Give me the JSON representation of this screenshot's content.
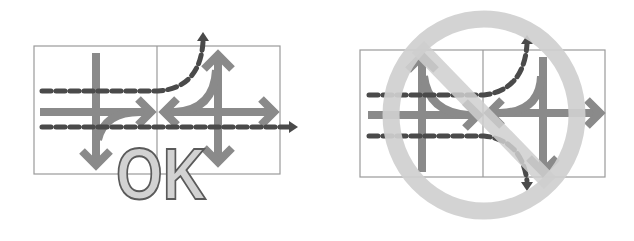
{
  "figure": {
    "left_panel": {
      "label": "OK",
      "verdict": "allowed",
      "description": "Crossing with lanes separated; dashed through lanes pass alongside solid turning arrows"
    },
    "right_panel": {
      "label": "",
      "verdict": "prohibited",
      "symbol": "prohibition-circle",
      "description": "Crossing where dashed paths curve across the solid turning arrows"
    },
    "colors": {
      "solid_arrow": "#8a8a8a",
      "dashed_arrow": "#4a4a4a",
      "ok_fill": "#d2d2d2",
      "ok_outline": "#5a5a5a",
      "prohibition": "#cfcfcf",
      "grid": "#9a9a9a"
    }
  }
}
